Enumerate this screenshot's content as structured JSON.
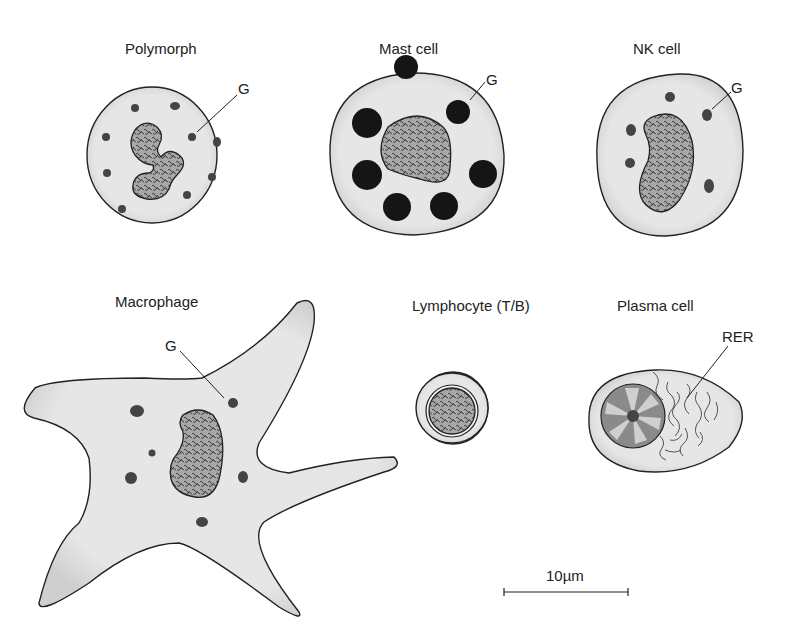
{
  "figure": {
    "type": "diagram",
    "cells": [
      {
        "id": "polymorph",
        "label": "Polymorph",
        "annotation": "G"
      },
      {
        "id": "mast-cell",
        "label": "Mast cell",
        "annotation": "G"
      },
      {
        "id": "nk-cell",
        "label": "NK cell",
        "annotation": "G"
      },
      {
        "id": "macrophage",
        "label": "Macrophage",
        "annotation": "G"
      },
      {
        "id": "lymphocyte",
        "label": "Lymphocyte (T/B)",
        "annotation": ""
      },
      {
        "id": "plasma-cell",
        "label": "Plasma cell",
        "annotation": "RER"
      }
    ],
    "scale_bar": {
      "label": "10µm"
    }
  },
  "colors": {
    "cytoplasm": "#e4e4e4",
    "outline": "#222222",
    "granule": "#444444",
    "mast_granule": "#151515",
    "nucleus": "#9a9a9a"
  }
}
